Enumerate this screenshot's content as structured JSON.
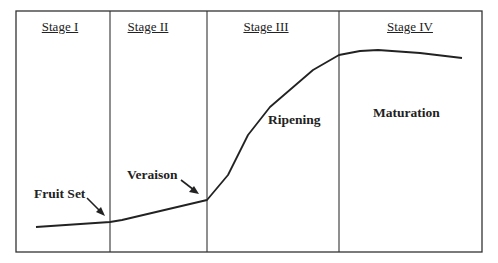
{
  "diagram": {
    "stages": [
      {
        "label": "Stage I",
        "center_x": 60
      },
      {
        "label": "Stage II",
        "center_x": 148
      },
      {
        "label": "Stage III",
        "center_x": 266
      },
      {
        "label": "Stage IV",
        "center_x": 410
      }
    ],
    "phases": [
      {
        "label": "Fruit Set",
        "x": 34,
        "y": 186
      },
      {
        "label": "Veraison",
        "x": 127,
        "y": 167
      },
      {
        "label": "Ripening",
        "x": 268,
        "y": 112
      },
      {
        "label": "Maturation",
        "x": 373,
        "y": 105
      }
    ],
    "colors": {
      "line": "#222222",
      "frame": "#333333",
      "background": "#ffffff"
    }
  },
  "chart_data": {
    "type": "line",
    "title": "",
    "xlabel": "",
    "ylabel": "",
    "stages": [
      "Stage I",
      "Stage II",
      "Stage III",
      "Stage IV"
    ],
    "annotations": [
      "Fruit Set",
      "Veraison",
      "Ripening",
      "Maturation"
    ],
    "curve_pixels": [
      [
        36,
        227
      ],
      [
        110,
        222
      ],
      [
        122,
        220
      ],
      [
        207,
        200
      ],
      [
        228,
        175
      ],
      [
        248,
        135
      ],
      [
        270,
        107
      ],
      [
        313,
        70
      ],
      [
        339,
        55
      ],
      [
        360,
        51
      ],
      [
        378,
        50
      ],
      [
        420,
        53
      ],
      [
        462,
        58
      ]
    ],
    "grid": false,
    "legend": "none"
  }
}
